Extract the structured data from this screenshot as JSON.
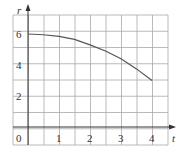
{
  "chart_data": {
    "type": "line",
    "title": "",
    "xlabel": "t",
    "ylabel": "r",
    "x": [
      0,
      0.5,
      1,
      1.5,
      2,
      2.5,
      3,
      3.5,
      4
    ],
    "series": [
      {
        "name": "r(t)",
        "values": [
          6.0,
          5.95,
          5.85,
          5.65,
          5.3,
          4.9,
          4.4,
          3.75,
          3.0
        ]
      }
    ],
    "xticks": [
      "0",
      "1",
      "2",
      "3",
      "4"
    ],
    "yticks": [
      "2",
      "4",
      "6"
    ],
    "xlim": [
      -0.5,
      4.5
    ],
    "ylim": [
      -0.6,
      7.2
    ],
    "grid": true,
    "legend": "none",
    "colors": {
      "grid": "#a8a8a8",
      "axis": "#333333",
      "curve": "#555555"
    }
  }
}
